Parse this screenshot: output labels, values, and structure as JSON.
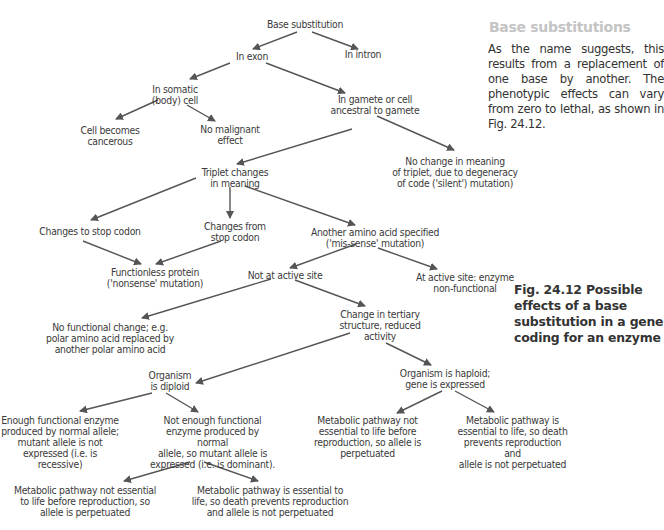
{
  "side_panel": {
    "heading": "Base substitutions",
    "body": "As the name suggests, this results from a replacement of one base by another. The phenotypic effects can vary from zero to lethal, as shown in Fig. 24.12."
  },
  "caption": "Fig. 24.12   Possible effects of a base substitution in a gene coding for an enzyme",
  "colors": {
    "heading": "#c4c4c4",
    "text": "#3a3a3a",
    "arrow": "#555555"
  },
  "nodes": {
    "base_substitution": "Base substitution",
    "in_exon": "In exon",
    "in_intron": "In intron",
    "in_somatic": "In somatic\n(body) cell",
    "in_gamete": "In gamete or cell\nancestral to gamete",
    "cell_cancerous": "Cell becomes\ncancerous",
    "no_malignant": "No malignant\neffect",
    "triplet_changes": "Triplet changes\nin meaning",
    "no_change_meaning": "No change in meaning\nof triplet, due to degeneracy\nof code ('silent') mutation)",
    "changes_to_stop": "Changes to stop codon",
    "changes_from_stop": "Changes from\nstop codon",
    "another_amino": "Another amino acid specified\n('mis-sense' mutation)",
    "functionless": "Functionless protein\n('nonsense' mutation)",
    "not_active_site": "Not at active site",
    "at_active_site": "At active site: enzyme\nnon-functional",
    "no_functional_change": "No functional change; e.g.\npolar amino acid replaced by\nanother polar amino acid",
    "tertiary_change": "Change in tertiary\nstructure, reduced\nactivity",
    "diploid": "Organism\nis diploid",
    "haploid": "Organism is haploid;\ngene is expressed",
    "enough_enzyme": "Enough functional enzyme\nproduced by normal allele;\nmutant allele is not\nexpressed (i.e. is recessive)",
    "not_enough_enzyme": "Not enough functional\nenzyme produced by normal\nallele, so mutant allele is\nexpressed (i.e. is dominant).",
    "haploid_not_essential": "Metabolic pathway not\nessential to life before\nreproduction, so allele is\nperpetuated",
    "haploid_essential": "Metabolic pathway is\nessential to life, so death\nprevents reproduction and\nallele is not perpetuated",
    "diploid_not_essential": "Metabolic pathway not essential\nto life before reproduction, so\nallele is perpetuated",
    "diploid_essential": "Metabolic pathway is essential to\nlife, so death prevents reproduction\nand allele is not perpetuated"
  }
}
